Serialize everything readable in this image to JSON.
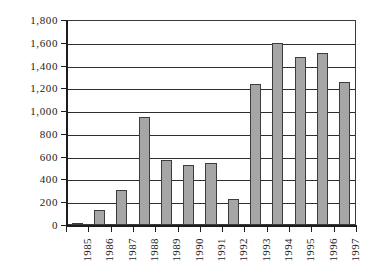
{
  "chart_data": {
    "type": "bar",
    "title": "",
    "xlabel": "",
    "ylabel": "",
    "categories": [
      "1985",
      "1986",
      "1987",
      "1988",
      "1989",
      "1990",
      "1991",
      "1992",
      "1993",
      "1994",
      "1995",
      "1996",
      "1997"
    ],
    "values": [
      15,
      135,
      310,
      945,
      570,
      530,
      545,
      225,
      1235,
      1600,
      1475,
      1510,
      1255
    ],
    "ylim": [
      0,
      1800
    ],
    "ytick_step": 200,
    "ytick_labels": [
      "1,800",
      "1,600",
      "1,400",
      "1,200",
      "1,000",
      "800",
      "600",
      "400",
      "200",
      "0"
    ],
    "ytick_values": [
      1800,
      1600,
      1400,
      1200,
      1000,
      800,
      600,
      400,
      200,
      0
    ],
    "grid": true,
    "legend": "none",
    "series": [
      {
        "name": "",
        "values": [
          15,
          135,
          310,
          945,
          570,
          530,
          545,
          225,
          1235,
          1600,
          1475,
          1510,
          1255
        ]
      }
    ],
    "colors": {
      "bar_fill": "#a6a6a6",
      "bar_border": "#3c3c3c",
      "gridline": "#2e2e2e",
      "axis": "#1d1d1d",
      "background": "#ffffff",
      "text": "#1a1a1a"
    }
  }
}
